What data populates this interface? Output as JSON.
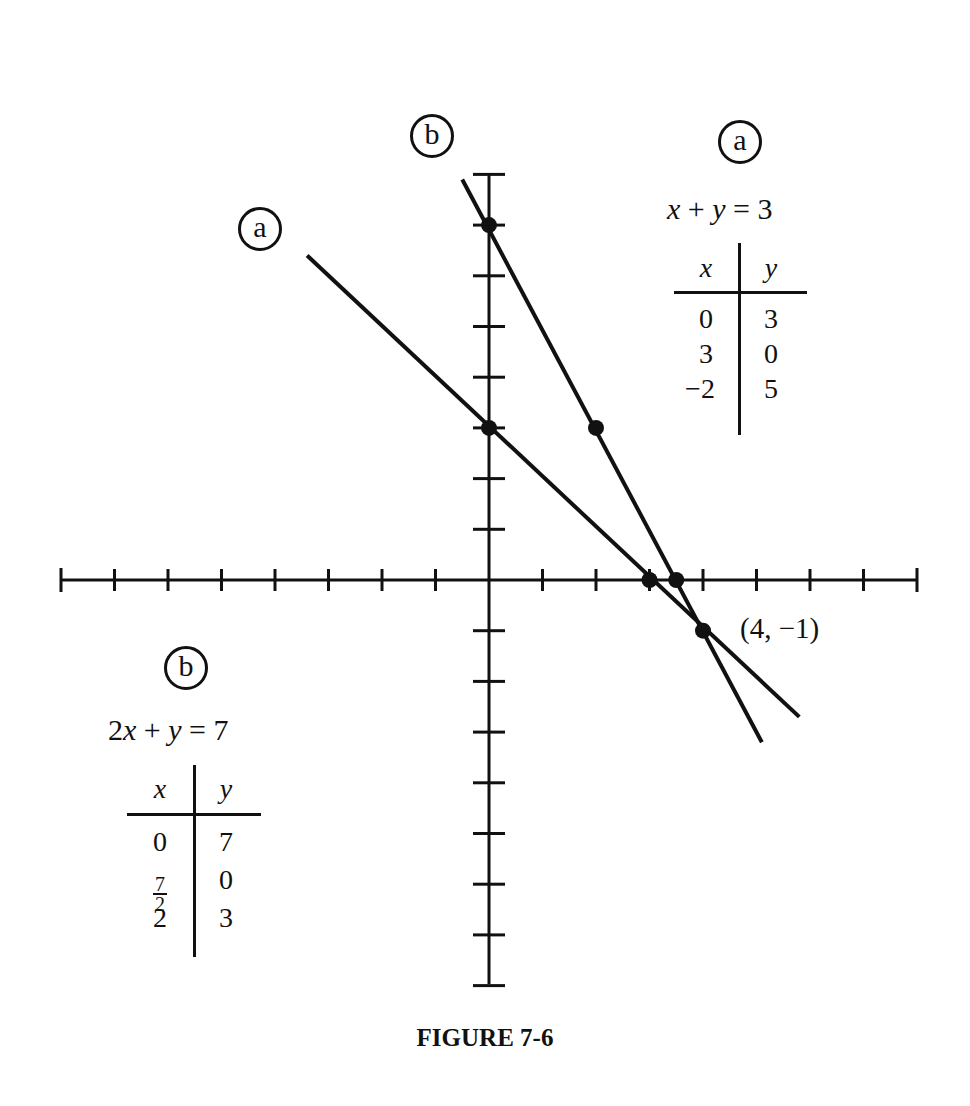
{
  "chart_data": {
    "type": "line",
    "title": "FIGURE 7-6",
    "xlabel": "",
    "ylabel": "",
    "xlim": [
      -8,
      8
    ],
    "ylim": [
      -8,
      8
    ],
    "grid": false,
    "x_ticks": [
      -8,
      -7,
      -6,
      -5,
      -4,
      -3,
      -2,
      -1,
      0,
      1,
      2,
      3,
      4,
      5,
      6,
      7,
      8
    ],
    "y_ticks": [
      -8,
      -7,
      -6,
      -5,
      -4,
      -3,
      -2,
      -1,
      0,
      1,
      2,
      3,
      4,
      5,
      6,
      7,
      8
    ],
    "series": [
      {
        "name": "a",
        "equation": "x + y = 3",
        "segment": [
          [
            -3.4,
            6.4
          ],
          [
            5.8,
            -2.7
          ]
        ],
        "points": [
          [
            0,
            3
          ],
          [
            3,
            0
          ],
          [
            4,
            -1
          ]
        ]
      },
      {
        "name": "b",
        "equation": "2x + y = 7",
        "segment": [
          [
            -0.5,
            7.9
          ],
          [
            5.1,
            -3.2
          ]
        ],
        "points": [
          [
            0,
            7
          ],
          [
            3.5,
            0
          ],
          [
            2,
            3
          ],
          [
            4,
            -1
          ]
        ]
      }
    ],
    "annotations": [
      {
        "text": "(4, −1)",
        "x": 4,
        "y": -1,
        "note": "intersection point"
      }
    ],
    "tables": [
      {
        "name": "a",
        "equation": "x + y = 3",
        "columns": [
          "x",
          "y"
        ],
        "rows": [
          [
            "0",
            "3"
          ],
          [
            "3",
            "0"
          ],
          [
            "−2",
            "5"
          ]
        ]
      },
      {
        "name": "b",
        "equation": "2x + y = 7",
        "columns": [
          "x",
          "y"
        ],
        "rows": [
          [
            "0",
            "7"
          ],
          [
            "7/2",
            "0"
          ],
          [
            "2",
            "3"
          ]
        ]
      }
    ]
  },
  "labels": {
    "line_a_tag": "a",
    "line_b_tag": "b",
    "table_a_tag": "a",
    "table_b_tag": "b",
    "intersection": "(4, −1)",
    "caption": "FIGURE 7-6"
  },
  "table_a": {
    "eq_x": "x",
    "eq_plus": " + ",
    "eq_y": "y",
    "eq_rhs": " = 3",
    "head_x": "x",
    "head_y": "y",
    "x_vals": [
      "0",
      "3",
      "−2"
    ],
    "y_vals": [
      "3",
      "0",
      "5"
    ]
  },
  "table_b": {
    "eq_coef": "2",
    "eq_x": "x",
    "eq_plus": " + ",
    "eq_y": "y",
    "eq_rhs": " = 7",
    "head_x": "x",
    "head_y": "y",
    "x0": "0",
    "x1_num": "7",
    "x1_den": "2",
    "x2": "2",
    "y_vals": [
      "7",
      "0",
      "3"
    ]
  },
  "style": {
    "ink": "#111111",
    "background": "#ffffff"
  }
}
